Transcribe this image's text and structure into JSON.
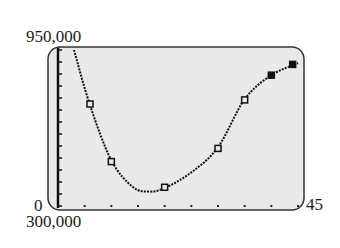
{
  "window": {
    "xmin_label": "0",
    "xmax_label": "45",
    "ymin_label": "300,000",
    "ymax_label": "950,000"
  },
  "colors": {
    "screen_bg": "#e9e9e9",
    "ink": "#111111",
    "frame": "#333333"
  },
  "chart_data": {
    "type": "scatter",
    "title": "",
    "xlabel": "",
    "ylabel": "",
    "xlim": [
      0,
      45
    ],
    "ylim": [
      300000,
      950000
    ],
    "xscl": 5,
    "yscl": 50000,
    "grid": false,
    "legend": null,
    "series": [
      {
        "name": "data points",
        "marker": "square",
        "x": [
          6,
          10,
          20,
          30,
          35,
          40,
          44
        ],
        "y": [
          725000,
          485000,
          378000,
          540000,
          742000,
          845000,
          890000
        ]
      },
      {
        "name": "regression curve",
        "style": "dotted-line",
        "x": [
          3,
          6,
          10,
          14,
          17,
          20,
          25,
          30,
          35,
          40,
          45
        ],
        "y": [
          950000,
          720000,
          490000,
          380000,
          360000,
          375000,
          440000,
          545000,
          745000,
          845000,
          895000
        ]
      }
    ]
  }
}
